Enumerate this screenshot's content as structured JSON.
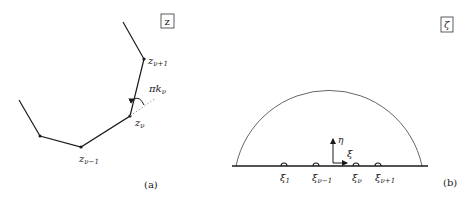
{
  "panel_a": {
    "frame_label": "z",
    "caption": "(a)",
    "vertices": {
      "z_v_plus_1": "z",
      "z_v_plus_1_sub": "ν+1",
      "z_v": "z",
      "z_v_sub": "ν",
      "z_v_minus_1": "z",
      "z_v_minus_1_sub": "ν−1"
    },
    "angle_label": "πk",
    "angle_label_sub": "ν"
  },
  "panel_b": {
    "frame_label": "ζ",
    "caption": "(b)",
    "axes": {
      "vertical": "η",
      "horizontal": "ξ"
    },
    "points": [
      {
        "label": "ξ",
        "sub": "1"
      },
      {
        "label": "ξ",
        "sub": "ν−1"
      },
      {
        "label": "ξ",
        "sub": "ν"
      },
      {
        "label": "ξ",
        "sub": "ν+1"
      }
    ]
  },
  "colors": {
    "ink": "#1a1a1a",
    "dotted": "#999999",
    "background": "#ffffff"
  }
}
